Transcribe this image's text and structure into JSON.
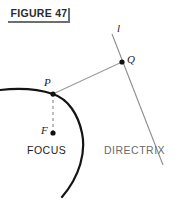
{
  "figure": {
    "label": "FIGURE 47",
    "title_underline": true
  },
  "labels": {
    "line_l": "l",
    "point_q": "Q",
    "point_p": "P",
    "point_f": "F",
    "focus_caption": "FOCUS",
    "directrix_caption": "DIRECTRIX"
  },
  "colors": {
    "curve": "#141414",
    "directrix_line": "#8d8d8d",
    "pq_segment": "#9a9a9a",
    "dashed_pf": "#9a9a9a",
    "point_fill": "#111111",
    "label_text": "#1a1a1a",
    "caption_focus": "#242424",
    "caption_directrix": "#6a6a6a",
    "rule": "#6e6e6e",
    "background": "#ffffff"
  },
  "geometry": {
    "conic_curve": {
      "description": "parabola branch opening left-downward",
      "path": "M 0,90 C 18,88 38,89 53,94 C 68,99 78,114 82,133 C 86,152 80,176 62,197"
    },
    "directrix": {
      "x1": 112,
      "y1": 34,
      "x2": 163,
      "y2": 165
    },
    "pq_segment": {
      "x1": 53,
      "y1": 94,
      "x2": 122,
      "y2": 62
    },
    "pf_dashed": {
      "x1": 53,
      "y1": 94,
      "x2": 53,
      "y2": 133,
      "dash": "3 3"
    },
    "points": [
      {
        "name": "P",
        "x": 53,
        "y": 94,
        "r": 2.6
      },
      {
        "name": "Q",
        "x": 122,
        "y": 62,
        "r": 2.6
      },
      {
        "name": "F",
        "x": 53,
        "y": 133,
        "r": 2.6
      }
    ]
  }
}
